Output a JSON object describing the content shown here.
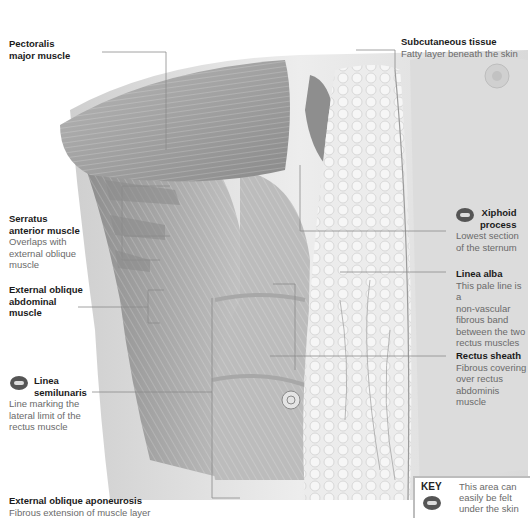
{
  "figure": {
    "palette": {
      "background": "#ffffff",
      "muscle": "#9a9a9a",
      "muscle_dark": "#6e6e6e",
      "fat": "#e8e8e8",
      "skin": "#d6d6d6",
      "leader_line": "#888888",
      "title_text": "#1a1a1a",
      "desc_text": "#6a6a6a",
      "badge": "#555555"
    }
  },
  "labels": [
    {
      "id": "pectoralis",
      "title": "Pectoralis major muscle",
      "title_lines": [
        "Pectoralis",
        "major muscle"
      ],
      "description": "",
      "side": "left",
      "has_icon": false
    },
    {
      "id": "subcutaneous",
      "title": "Subcutaneous tissue",
      "description": "Fatty layer beneath the skin",
      "side": "right",
      "has_icon": false
    },
    {
      "id": "serratus",
      "title": "Serratus anterior muscle",
      "title_lines": [
        "Serratus",
        "anterior muscle"
      ],
      "description": "Overlaps with external oblique muscle",
      "desc_lines": [
        "Overlaps with",
        "external oblique",
        "muscle"
      ],
      "side": "left",
      "has_icon": false
    },
    {
      "id": "xiphoid",
      "title": "Xiphoid process",
      "title_lines": [
        "Xiphoid",
        "process"
      ],
      "description": "Lowest section of the sternum",
      "desc_lines": [
        "Lowest section",
        "of the sternum"
      ],
      "side": "right",
      "has_icon": true
    },
    {
      "id": "linea_alba",
      "title": "Linea alba",
      "description": "This pale line is a non-vascular fibrous band between the two rectus muscles",
      "desc_lines": [
        "This pale line is a",
        "non-vascular",
        "fibrous band",
        "between the two",
        "rectus muscles"
      ],
      "side": "right",
      "has_icon": false
    },
    {
      "id": "external_oblique",
      "title": "External oblique abdominal muscle",
      "title_lines": [
        "External oblique",
        "abdominal",
        "muscle"
      ],
      "description": "",
      "side": "left",
      "has_icon": false
    },
    {
      "id": "rectus_sheath",
      "title": "Rectus sheath",
      "description": "Fibrous covering over rectus abdominis muscle",
      "desc_lines": [
        "Fibrous covering",
        "over rectus",
        "abdominis muscle"
      ],
      "side": "right",
      "has_icon": false
    },
    {
      "id": "linea_semilunaris",
      "title": "Linea semilunaris",
      "title_lines": [
        "Linea",
        "semilunaris"
      ],
      "description": "Line marking the lateral limit of the rectus muscle",
      "desc_lines": [
        "Line marking the",
        "lateral limit of the",
        "rectus muscle"
      ],
      "side": "left",
      "has_icon": true
    },
    {
      "id": "aponeurosis",
      "title": "External oblique aponeurosis",
      "description": "Fibrous extension of muscle layer",
      "side": "left",
      "has_icon": false
    }
  ],
  "key": {
    "label": "KEY",
    "icon": "palpation-hand-icon",
    "text_lines": [
      "This area can",
      "easily be felt",
      "under the skin"
    ]
  }
}
